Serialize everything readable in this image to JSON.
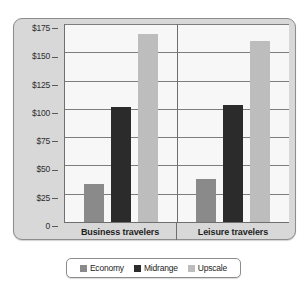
{
  "chart_data": {
    "type": "bar",
    "title": "",
    "subtitle": "",
    "xlabel": "",
    "ylabel": "",
    "categories": [
      "Business travelers",
      "Leisure travelers"
    ],
    "series": [
      {
        "name": "Economy",
        "color": "#8a8a8a",
        "values": [
          34,
          38
        ]
      },
      {
        "name": "Midrange",
        "color": "#2b2b2b",
        "values": [
          102,
          103
        ]
      },
      {
        "name": "Upscale",
        "color": "#bdbdbd",
        "values": [
          166,
          160
        ]
      }
    ],
    "ylim": [
      0,
      175
    ],
    "ytick_values": [
      175,
      150,
      125,
      100,
      75,
      50,
      25,
      0
    ],
    "ytick_labels": [
      "$175",
      "$150",
      "$125",
      "$100",
      "$75",
      "$50",
      "$25",
      "0"
    ],
    "grid": true,
    "legend_position": "bottom",
    "colors": {
      "panel_background": "#d8d8d8",
      "panel_border": "#8d8d8d",
      "plot_background": "#f7f7f7",
      "gridline": "#7d7d7d",
      "axis": "#6f6f6f",
      "text": "#1d1d1d",
      "legend_background": "#ffffff"
    }
  },
  "legend": {
    "items": [
      {
        "label": "Economy",
        "color": "#8a8a8a"
      },
      {
        "label": "Midrange",
        "color": "#2b2b2b"
      },
      {
        "label": "Upscale",
        "color": "#bdbdbd"
      }
    ]
  }
}
